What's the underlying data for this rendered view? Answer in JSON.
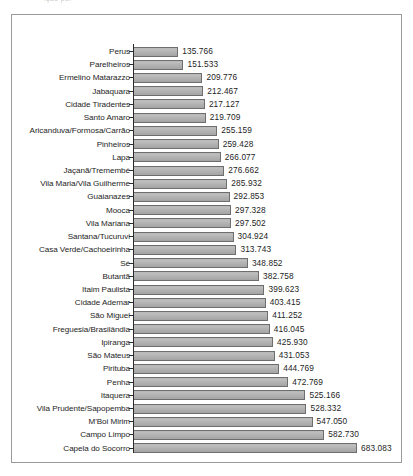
{
  "top_clip_text": "ição por",
  "chart_data": {
    "type": "bar",
    "orientation": "horizontal",
    "title": "",
    "subtitle": "",
    "xlabel": "",
    "ylabel": "",
    "grid": false,
    "legend": null,
    "axis_line": true,
    "value_label_format": "dot-thousands",
    "xlim": [
      0,
      683083
    ],
    "categories": [
      "Perus",
      "Parelheiros",
      "Ermelino Matarazzo",
      "Jabaquara",
      "Cidade Tiradentes",
      "Santo Amaro",
      "Aricanduva/Formosa/Carrão",
      "Pinheiros",
      "Lapa",
      "Jaçanã/Tremembé",
      "Vila Maria/Vila Guilherme",
      "Guaianazes",
      "Mooca",
      "Vila Mariana",
      "Santana/Tucuruvi",
      "Casa Verde/Cachoeirinha",
      "Sé",
      "Butantã",
      "Itaim Paulista",
      "Cidade Ademar",
      "São Miguel",
      "Freguesia/Brasilândia",
      "Ipiranga",
      "São Mateus",
      "Pirituba",
      "Penha",
      "Itaquera",
      "Vila Prudente/Sapopemba",
      "M'Boi Mirim",
      "Campo Limpo",
      "Capela do Socorro"
    ],
    "values": [
      135766,
      151533,
      209776,
      212467,
      217127,
      219709,
      255159,
      259428,
      266077,
      276662,
      285932,
      292853,
      297328,
      297502,
      304924,
      313743,
      348852,
      382758,
      399623,
      403415,
      411252,
      416045,
      425930,
      431053,
      444769,
      472769,
      525166,
      528332,
      547050,
      582730,
      683083
    ],
    "value_labels": [
      "135.766",
      "151.533",
      "209.776",
      "212.467",
      "217.127",
      "219.709",
      "255.159",
      "259.428",
      "266.077",
      "276.662",
      "285.932",
      "292.853",
      "297.328",
      "297.502",
      "304.924",
      "313.743",
      "348.852",
      "382.758",
      "399.623",
      "403.415",
      "411.252",
      "416.045",
      "425.930",
      "431.053",
      "444.769",
      "472.769",
      "525.166",
      "528.332",
      "547.050",
      "582.730",
      "683.083"
    ],
    "colors": {
      "bar_fill": "#b4b4b4",
      "bar_border": "#6e6e6e",
      "axis": "#2b2b2b",
      "frame": "#9a9a9a",
      "text": "#1d1d1d",
      "background": "#ffffff"
    }
  }
}
